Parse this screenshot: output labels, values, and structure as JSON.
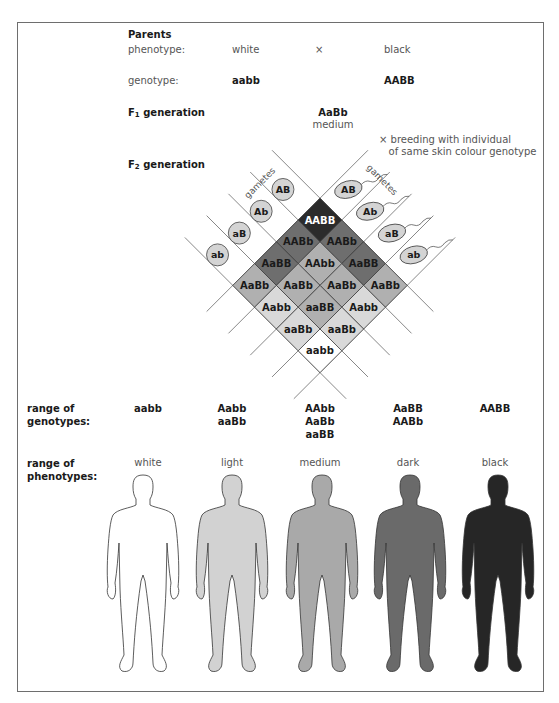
{
  "parents": {
    "heading": "Parents",
    "phenotype_label": "phenotype:",
    "phenotype_left": "white",
    "cross_symbol": "×",
    "phenotype_right": "black",
    "genotype_label": "genotype:",
    "genotype_left": "aabb",
    "genotype_right": "AABB"
  },
  "f1": {
    "heading_prefix": "F",
    "heading_sub": "1",
    "heading_suffix": " generation",
    "genotype": "AaBb",
    "phenotype": "medium"
  },
  "breeding_note": {
    "symbol": "×",
    "line1": "breeding with individual",
    "line2": "of same skin colour genotype"
  },
  "f2": {
    "heading_prefix": "F",
    "heading_sub": "2",
    "heading_suffix": " generation",
    "gametes_label_left": "gametes",
    "gametes_label_right": "gametes",
    "gametes_left": [
      "AB",
      "Ab",
      "aB",
      "ab"
    ],
    "gametes_right": [
      "AB",
      "Ab",
      "aB",
      "ab"
    ],
    "grid": [
      [
        "AABB",
        "AABb",
        "AaBB",
        "AaBb"
      ],
      [
        "AABb",
        "AAbb",
        "AaBb",
        "Aabb"
      ],
      [
        "AaBB",
        "AaBb",
        "aaBB",
        "aaBb"
      ],
      [
        "AaBb",
        "Aabb",
        "aaBb",
        "aabb"
      ]
    ]
  },
  "range": {
    "genotypes_label_1": "range of",
    "genotypes_label_2": "genotypes:",
    "phenotypes_label_1": "range of",
    "phenotypes_label_2": "phenotypes:",
    "columns": [
      {
        "genotypes": [
          "aabb"
        ],
        "phenotype": "white",
        "color": "#ffffff"
      },
      {
        "genotypes": [
          "Aabb",
          "aaBb"
        ],
        "phenotype": "light",
        "color": "#d2d2d2"
      },
      {
        "genotypes": [
          "AAbb",
          "AaBb",
          "aaBB"
        ],
        "phenotype": "medium",
        "color": "#a9a9a9"
      },
      {
        "genotypes": [
          "AaBB",
          "AABb"
        ],
        "phenotype": "dark",
        "color": "#6a6a6a"
      },
      {
        "genotypes": [
          "AABB"
        ],
        "phenotype": "black",
        "color": "#262626"
      }
    ]
  },
  "colors": {
    "dominant_0": "#ffffff",
    "dominant_1": "#d9d9d9",
    "dominant_2": "#b0b0b0",
    "dominant_3": "#6e6e6e",
    "dominant_4": "#2b2b2b",
    "gamete_fill": "#d4d4d4",
    "frame": "#6e6e6e"
  }
}
